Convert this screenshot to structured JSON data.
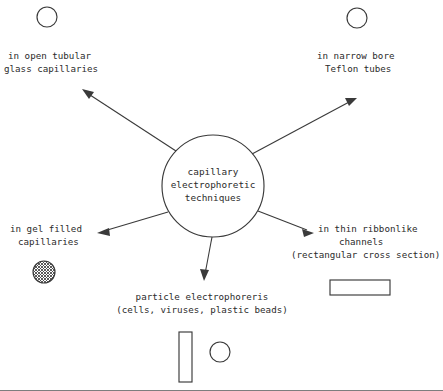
{
  "diagram": {
    "title_node": {
      "name": "capillary-electrophoretic-techniques",
      "lines": [
        "capillary",
        "electrophoretic",
        "techniques"
      ],
      "shape": "circle"
    },
    "branches": [
      {
        "id": "open-tubular-glass-capillaries",
        "lines": [
          "in open tubular",
          "glass capillaries"
        ],
        "icon": "open-circle-cross-section",
        "direction": "upper-left"
      },
      {
        "id": "narrow-bore-teflon-tubes",
        "lines": [
          "in narrow bore",
          "Teflon tubes"
        ],
        "icon": "open-circle-cross-section",
        "direction": "upper-right"
      },
      {
        "id": "gel-filled-capillaries",
        "lines": [
          "in gel filled",
          "capillaries"
        ],
        "icon": "hatched-circle-cross-section",
        "direction": "lower-left"
      },
      {
        "id": "thin-ribbonlike-channels",
        "lines": [
          "in thin ribbonlike",
          "channels",
          "(rectangular cross section)"
        ],
        "icon": "wide-rectangle-cross-section",
        "direction": "lower-right"
      },
      {
        "id": "particle-electrophoresis",
        "lines": [
          "particle electrophoreris",
          "(cells, viruses, plastic beads)"
        ],
        "icon": "tall-rectangle-and-circle-cross-section",
        "direction": "down"
      }
    ],
    "colors": {
      "ink": "#3a3a3a",
      "text": "#2b2b2b",
      "background": "#ffffff",
      "rule": "#6f6f6f"
    }
  }
}
